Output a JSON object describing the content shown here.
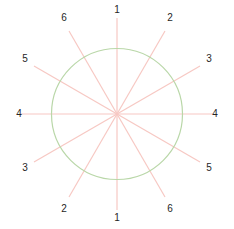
{
  "figure": {
    "width": 234,
    "height": 229,
    "background": "#ffffff"
  },
  "style": {
    "spoke_color": "#f7c8c3",
    "spoke_width": 1.2,
    "circle_color": "#b9d7a8",
    "circle_width": 1.2,
    "label_color": "#262626",
    "label_font_size": 10
  },
  "chart_data": {
    "type": "line",
    "subtype": "polar-radial-spokes",
    "title": "",
    "subtitle": "",
    "xlabel": "",
    "ylabel": "",
    "grid": false,
    "legend": null,
    "center": {
      "x": 117,
      "y": 114
    },
    "circle": {
      "cx": 117,
      "cy": 114,
      "r": 65.5
    },
    "spoke_length": 96,
    "label_radius": 109,
    "axis_count": 6,
    "angle_step_deg": 30,
    "categories": [
      "1",
      "2",
      "3",
      "4",
      "5",
      "6"
    ],
    "lines": [
      {
        "id": "axis-1",
        "label": "1",
        "angle_deg": 90,
        "x1": 117,
        "y1": 18,
        "x2": 117,
        "y2": 210
      },
      {
        "id": "axis-2",
        "label": "2",
        "angle_deg": 60,
        "x1": 165,
        "y1": 31,
        "x2": 69,
        "y2": 197
      },
      {
        "id": "axis-3",
        "label": "3",
        "angle_deg": 30,
        "x1": 200,
        "y1": 66,
        "x2": 34,
        "y2": 162
      },
      {
        "id": "axis-4",
        "label": "4",
        "angle_deg": 0,
        "x1": 213,
        "y1": 114,
        "x2": 21,
        "y2": 114
      },
      {
        "id": "axis-5",
        "label": "5",
        "angle_deg": 150,
        "x1": 34,
        "y1": 66,
        "x2": 200,
        "y2": 162
      },
      {
        "id": "axis-6",
        "label": "6",
        "angle_deg": 120,
        "x1": 69,
        "y1": 31,
        "x2": 165,
        "y2": 197
      }
    ],
    "tick_labels": [
      {
        "text": "1",
        "x": 117,
        "y": 10,
        "position": "top",
        "axis": "1"
      },
      {
        "text": "2",
        "x": 170,
        "y": 18,
        "position": "top-right",
        "axis": "2"
      },
      {
        "text": "3",
        "x": 209,
        "y": 59,
        "position": "right-upper",
        "axis": "3"
      },
      {
        "text": "4",
        "x": 215,
        "y": 114,
        "position": "right",
        "axis": "4"
      },
      {
        "text": "5",
        "x": 209,
        "y": 168,
        "position": "right-lower",
        "axis": "5"
      },
      {
        "text": "6",
        "x": 170,
        "y": 209,
        "position": "bottom-right",
        "axis": "6"
      },
      {
        "text": "1",
        "x": 117,
        "y": 218,
        "position": "bottom",
        "axis": "1"
      },
      {
        "text": "2",
        "x": 64,
        "y": 209,
        "position": "bottom-left",
        "axis": "2"
      },
      {
        "text": "3",
        "x": 25,
        "y": 168,
        "position": "left-lower",
        "axis": "3"
      },
      {
        "text": "4",
        "x": 19,
        "y": 114,
        "position": "left",
        "axis": "4"
      },
      {
        "text": "5",
        "x": 25,
        "y": 59,
        "position": "left-upper",
        "axis": "5"
      },
      {
        "text": "6",
        "x": 64,
        "y": 18,
        "position": "top-left",
        "axis": "6"
      }
    ]
  }
}
